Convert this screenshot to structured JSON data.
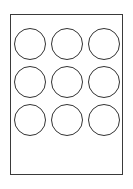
{
  "document": {
    "type": "label-sheet-template",
    "title": "",
    "page": {
      "background_color": "#ffffff",
      "border_color": "#3a3a3a",
      "border_width_px": 1,
      "x_px": 10,
      "y_px": 14,
      "width_px": 113,
      "height_px": 161
    },
    "labels": {
      "shape": "circle",
      "fill_color": "#ffffff",
      "outline_color": "#333333",
      "outline_width_px": 1,
      "diameter_px": 32,
      "rows": 3,
      "columns": 3,
      "count": 9,
      "items": [
        {
          "id": "label-r1c1",
          "row": 1,
          "column": 1,
          "text": ""
        },
        {
          "id": "label-r1c2",
          "row": 1,
          "column": 2,
          "text": ""
        },
        {
          "id": "label-r1c3",
          "row": 1,
          "column": 3,
          "text": ""
        },
        {
          "id": "label-r2c1",
          "row": 2,
          "column": 1,
          "text": ""
        },
        {
          "id": "label-r2c2",
          "row": 2,
          "column": 2,
          "text": ""
        },
        {
          "id": "label-r2c3",
          "row": 2,
          "column": 3,
          "text": ""
        },
        {
          "id": "label-r3c1",
          "row": 3,
          "column": 1,
          "text": ""
        },
        {
          "id": "label-r3c2",
          "row": 3,
          "column": 2,
          "text": ""
        },
        {
          "id": "label-r3c3",
          "row": 3,
          "column": 3,
          "text": ""
        }
      ]
    },
    "canvas": {
      "background_color": "#ffffff",
      "width_px": 133,
      "height_px": 189
    }
  }
}
